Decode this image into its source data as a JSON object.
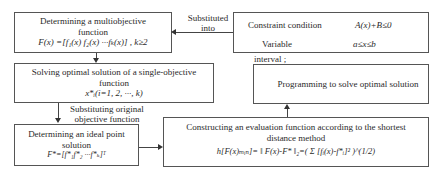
{
  "nodes": {
    "multiobjective": {
      "title_line1": "Determining a multiobjective",
      "title_line2": "function",
      "formula": "F(x) =[f₁(x) f₂(x) ···fₖ(x)] ,  k≥2"
    },
    "single_objective": {
      "title_line1": "Solving optimal solution of a single-objective",
      "title_line2": "function",
      "formula": "x*ᵢ(i=1,  2,  ···,  k)"
    },
    "ideal_point": {
      "title_line1": "Determining an ideal point",
      "title_line2": "solution",
      "formula": "F*=[f*₁f*₂ ···f*ₖ]ᵀ"
    },
    "constraint": {
      "label1": "Constraint condition",
      "formula1": "A(x)+B≤0",
      "label2": "Variable",
      "formula2": "a≤x≤b",
      "label2_cont": "interval ;"
    },
    "programming": {
      "title": "Programming to solve optimal solution"
    },
    "evaluation": {
      "title_line1": "Constructing an evaluation function according to the shortest",
      "title_line2": "distance method",
      "formula": "h[F(x)ₘᵢₙ]= ‖ F(x)-F* ‖₂=( Σ [fᵢ(x)-f*ᵢ]² )^(1/2)"
    }
  },
  "edges": {
    "substituted_into": {
      "line1": "Substituted",
      "line2": "into"
    },
    "substituting_original": {
      "line1": "Substituting original",
      "line2": "objective function"
    }
  }
}
